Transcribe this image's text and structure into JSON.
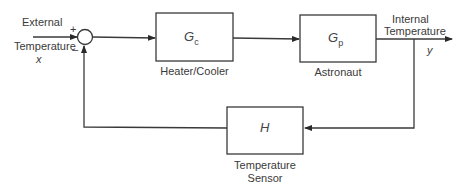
{
  "diagram": {
    "type": "feedback-control-block-diagram",
    "input": {
      "label_line1": "External",
      "label_line2": "Temperature",
      "symbol": "x"
    },
    "summing_junction": {
      "plus": "+",
      "minus": "–"
    },
    "blocks": [
      {
        "id": "controller",
        "symbol": "G",
        "subscript": "c",
        "caption": "Heater/Cooler"
      },
      {
        "id": "plant",
        "symbol": "G",
        "subscript": "p",
        "caption": "Astronaut"
      },
      {
        "id": "sensor",
        "symbol": "H",
        "subscript": "",
        "caption_line1": "Temperature",
        "caption_line2": "Sensor"
      }
    ],
    "output": {
      "label_line1": "Internal",
      "label_line2": "Temperature",
      "symbol": "y"
    },
    "colors": {
      "line": "#3a3a3a",
      "background": "#ffffff"
    }
  }
}
